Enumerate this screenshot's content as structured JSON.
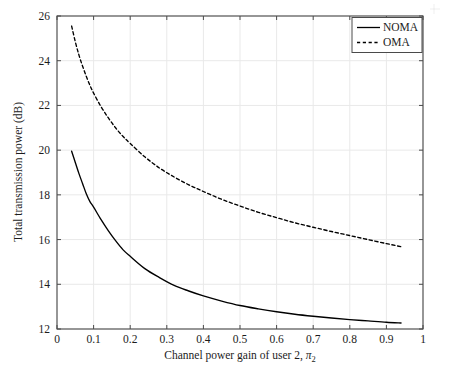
{
  "chart_data": {
    "type": "line",
    "title": "",
    "xlabel": "Channel power gain of user 2, π₂",
    "xlabel_text": "Channel power gain of user 2,",
    "xlabel_symbol": "π",
    "xlabel_symbol_sub": "2",
    "ylabel": "Total transmission power (dB)",
    "xlim": [
      0,
      1
    ],
    "ylim": [
      12,
      26
    ],
    "xticks": [
      "0",
      "0.1",
      "0.2",
      "0.3",
      "0.4",
      "0.5",
      "0.6",
      "0.7",
      "0.8",
      "0.9",
      "1"
    ],
    "xtick_values": [
      0,
      0.1,
      0.2,
      0.3,
      0.4,
      0.5,
      0.6,
      0.7,
      0.8,
      0.9,
      1
    ],
    "yticks": [
      "12",
      "14",
      "16",
      "18",
      "20",
      "22",
      "24",
      "26"
    ],
    "ytick_values": [
      12,
      14,
      16,
      18,
      20,
      22,
      24,
      26
    ],
    "grid": true,
    "legend_position": "top-right",
    "legend": [
      {
        "name": "NOMA",
        "style": "solid",
        "color": "#000000"
      },
      {
        "name": "OMA",
        "style": "dashed",
        "color": "#000000"
      }
    ],
    "series": [
      {
        "name": "NOMA",
        "style": "solid",
        "color": "#000000",
        "x": [
          0.04,
          0.05,
          0.06,
          0.07,
          0.08,
          0.09,
          0.1,
          0.12,
          0.14,
          0.16,
          0.18,
          0.2,
          0.24,
          0.28,
          0.32,
          0.36,
          0.4,
          0.45,
          0.5,
          0.55,
          0.6,
          0.65,
          0.7,
          0.75,
          0.8,
          0.85,
          0.9,
          0.94
        ],
        "y": [
          19.95,
          19.45,
          18.95,
          18.5,
          18.05,
          17.7,
          17.45,
          16.9,
          16.4,
          15.95,
          15.55,
          15.25,
          14.7,
          14.3,
          13.95,
          13.7,
          13.48,
          13.25,
          13.05,
          12.9,
          12.77,
          12.66,
          12.57,
          12.49,
          12.42,
          12.36,
          12.3,
          12.27
        ]
      },
      {
        "name": "OMA",
        "style": "dashed",
        "color": "#000000",
        "x": [
          0.04,
          0.05,
          0.06,
          0.07,
          0.08,
          0.09,
          0.1,
          0.12,
          0.14,
          0.16,
          0.18,
          0.2,
          0.24,
          0.28,
          0.32,
          0.36,
          0.4,
          0.45,
          0.5,
          0.55,
          0.6,
          0.65,
          0.7,
          0.75,
          0.8,
          0.85,
          0.9,
          0.94
        ],
        "y": [
          25.55,
          24.85,
          24.25,
          23.75,
          23.3,
          22.9,
          22.55,
          21.95,
          21.45,
          21.0,
          20.62,
          20.3,
          19.7,
          19.2,
          18.8,
          18.45,
          18.15,
          17.8,
          17.5,
          17.22,
          16.98,
          16.75,
          16.55,
          16.36,
          16.18,
          16.0,
          15.82,
          15.68
        ]
      }
    ]
  }
}
